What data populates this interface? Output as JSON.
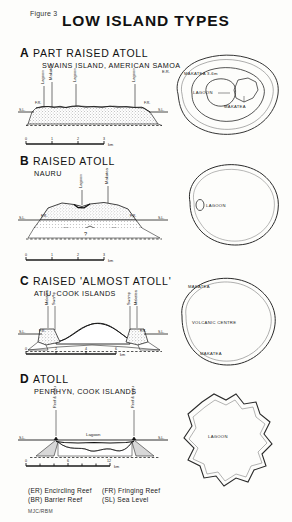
{
  "figure": {
    "number_label": "Figure 3",
    "title": "LOW ISLAND TYPES",
    "credit": "MJC/RBM"
  },
  "panels": [
    {
      "letter": "A",
      "title": "PART RAISED ATOLL",
      "subtitle": "SWAINS ISLAND, AMERICAN SAMOA",
      "cross_section": {
        "labels": [
          "F.R.",
          "Lagoon",
          "Makatea",
          "Lagoon",
          "Lagoon",
          "S.L.",
          "S.L.",
          "F.R."
        ],
        "sea_level_left": "S.L.",
        "sea_level_right": "S.L."
      },
      "scale": {
        "ticks": [
          "0",
          "1",
          "2",
          "3"
        ],
        "unit": "km"
      },
      "map": {
        "labels": [
          "MAKATEA 3-6m",
          "LAGOON",
          "MAKATEA"
        ],
        "outer_label": "E.R."
      }
    },
    {
      "letter": "B",
      "title": "RAISED ATOLL",
      "subtitle": "NAURU",
      "cross_section": {
        "labels": [
          "F.R.",
          "Lagoon",
          "Makatea",
          "F.R."
        ],
        "query_mark": "?",
        "sea_level_left": "S.L.",
        "sea_level_right": "S.L."
      },
      "scale": {
        "ticks": [
          "0",
          "1",
          "2",
          "3"
        ],
        "unit": "km"
      },
      "map": {
        "labels": [
          "LAGOON"
        ]
      }
    },
    {
      "letter": "C",
      "title": "RAISED 'ALMOST ATOLL'",
      "subtitle": "ATIU, COOK ISLANDS",
      "cross_section": {
        "labels": [
          "F.R.",
          "Makatea",
          "Swamp",
          "Swamp",
          "Makatea",
          "F.R."
        ],
        "sea_level_left": "S.L.",
        "sea_level_right": "S.L."
      },
      "scale": {
        "ticks": [
          "0",
          "2",
          "4",
          "6"
        ],
        "unit": "km"
      },
      "map": {
        "labels": [
          "MAKATEA",
          "VOLCANIC CENTRE",
          "MAKATEA"
        ]
      }
    },
    {
      "letter": "D",
      "title": "ATOLL",
      "subtitle": "PENRHYN, COOK ISLANDS",
      "cross_section": {
        "labels": [
          "Reef & motu",
          "Lagoon",
          "Reef & motu"
        ],
        "sea_level_left": "S.L.",
        "sea_level_right": "S.L."
      },
      "scale": {
        "ticks": [
          "0",
          "6",
          "12"
        ],
        "unit": "km"
      },
      "map": {
        "labels": [
          "LAGOON"
        ]
      }
    }
  ],
  "legend": {
    "entries": [
      {
        "abbr": "(ER)",
        "text": "Encircling Reef"
      },
      {
        "abbr": "(FR)",
        "text": "Fringing Reef"
      },
      {
        "abbr": "(BR)",
        "text": "Barrier Reef"
      },
      {
        "abbr": "(SL)",
        "text": "Sea Level"
      }
    ]
  }
}
